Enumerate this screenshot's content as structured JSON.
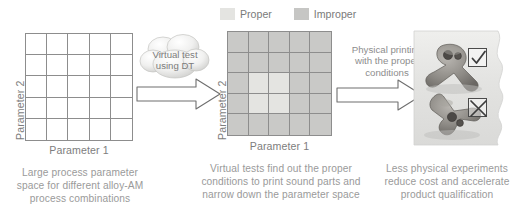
{
  "stages": [
    {
      "id": "design-space",
      "axis_y": "Parameter 2",
      "axis_x": "Parameter 1",
      "caption": "Large process parameter space for different alloy-AM process combinations",
      "grid": {
        "rows": 5,
        "cols": 5,
        "cells": [
          [
            "empty",
            "empty",
            "empty",
            "empty",
            "empty"
          ],
          [
            "empty",
            "empty",
            "empty",
            "empty",
            "empty"
          ],
          [
            "empty",
            "empty",
            "empty",
            "empty",
            "empty"
          ],
          [
            "empty",
            "empty",
            "empty",
            "empty",
            "empty"
          ],
          [
            "empty",
            "empty",
            "empty",
            "empty",
            "empty"
          ]
        ]
      }
    },
    {
      "id": "virtual-test",
      "axis_y": "Parameter 2",
      "axis_x": "Parameter 1",
      "caption": "Virtual tests find out the proper conditions to print sound parts and narrow down the parameter space",
      "legend": {
        "proper": "Proper",
        "improper": "Improper"
      },
      "grid": {
        "rows": 5,
        "cols": 5,
        "cells": [
          [
            "improper",
            "improper",
            "improper",
            "improper",
            "improper"
          ],
          [
            "improper",
            "improper",
            "improper",
            "improper",
            "improper"
          ],
          [
            "improper",
            "proper",
            "proper",
            "improper",
            "improper"
          ],
          [
            "improper",
            "proper",
            "proper",
            "improper",
            "improper"
          ],
          [
            "improper",
            "improper",
            "improper",
            "improper",
            "improper"
          ]
        ]
      }
    },
    {
      "id": "physical-printing",
      "caption": "Less physical experiments reduce cost and accelerate product qualification",
      "marks": [
        {
          "name": "accepted-part",
          "glyph": "check"
        },
        {
          "name": "rejected-part",
          "glyph": "cross"
        }
      ]
    }
  ],
  "connectors": [
    {
      "id": "virtual-test-connector",
      "cloud_label": "Virtual test\nusing DT",
      "cloud_label_line1": "Virtual test",
      "cloud_label_line2": "using DT"
    },
    {
      "id": "physical-printing-connector",
      "label_line1": "Physical printing",
      "label_line2": "with the proper",
      "label_line3": "conditions"
    }
  ],
  "colors": {
    "proper": "#e4e4e1",
    "improper": "#c9c9c7",
    "grid_line": "#8d8d8d",
    "text": "#8a8a8a",
    "arrow_stroke": "#6f6f6f"
  }
}
